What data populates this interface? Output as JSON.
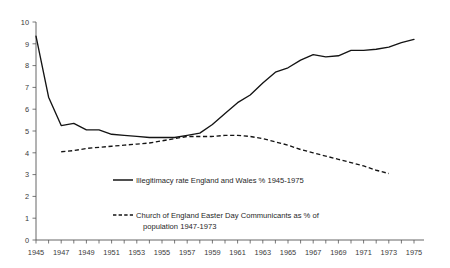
{
  "chart_data": {
    "type": "line",
    "title": "",
    "subtitle": "",
    "xlabel": "",
    "ylabel": "",
    "xlim": [
      1945,
      1975
    ],
    "ylim": [
      0,
      10
    ],
    "y_ticks": [
      "0",
      "1",
      "2",
      "3",
      "4",
      "5",
      "6",
      "7",
      "8",
      "9",
      "10"
    ],
    "x_ticks": [
      "1945",
      "1947",
      "1949",
      "1951",
      "1953",
      "1955",
      "1957",
      "1959",
      "1961",
      "1963",
      "1965",
      "1967",
      "1969",
      "1971",
      "1973",
      "1975"
    ],
    "x_tick_step": 2,
    "x_minor_step": 1,
    "grid": false,
    "legend_position": "inside-lower-left",
    "series": [
      {
        "name": "Illegitimacy rate England and Wales % 1945-1975",
        "style": "solid",
        "color": "#141414",
        "x": [
          1945,
          1946,
          1947,
          1948,
          1949,
          1950,
          1951,
          1952,
          1953,
          1954,
          1955,
          1956,
          1957,
          1958,
          1959,
          1960,
          1961,
          1962,
          1963,
          1964,
          1965,
          1966,
          1967,
          1968,
          1969,
          1970,
          1971,
          1972,
          1973,
          1974,
          1975
        ],
        "values": [
          9.35,
          6.55,
          5.25,
          5.35,
          5.05,
          5.05,
          4.85,
          4.8,
          4.75,
          4.7,
          4.7,
          4.7,
          4.8,
          4.9,
          5.3,
          5.8,
          6.3,
          6.65,
          7.2,
          7.7,
          7.9,
          8.25,
          8.5,
          8.4,
          8.45,
          8.7,
          8.7,
          8.75,
          8.85,
          9.05,
          9.2
        ]
      },
      {
        "name": "Church of England Easter Day Communicants as % of population 1947-1973",
        "style": "dashed",
        "color": "#141414",
        "x": [
          1947,
          1948,
          1949,
          1950,
          1951,
          1952,
          1953,
          1954,
          1955,
          1956,
          1957,
          1958,
          1959,
          1960,
          1961,
          1962,
          1963,
          1964,
          1965,
          1966,
          1967,
          1968,
          1969,
          1970,
          1971,
          1972,
          1973
        ],
        "values": [
          4.05,
          4.1,
          4.2,
          4.25,
          4.3,
          4.35,
          4.4,
          4.45,
          4.55,
          4.65,
          4.75,
          4.75,
          4.75,
          4.8,
          4.8,
          4.75,
          4.65,
          4.5,
          4.35,
          4.15,
          4.0,
          3.85,
          3.7,
          3.55,
          3.4,
          3.2,
          3.05
        ]
      }
    ]
  },
  "legend": {
    "entries": [
      {
        "label": "Illegitimacy rate England and Wales % 1945-1975",
        "style": "solid"
      },
      {
        "label_line1": "Church of England Easter Day Communicants as % of",
        "label_line2": "population 1947-1973",
        "style": "dashed"
      }
    ]
  },
  "colors": {
    "line": "#141414",
    "axis": "#555555",
    "text": "#1f1f1f",
    "background": "#ffffff"
  }
}
